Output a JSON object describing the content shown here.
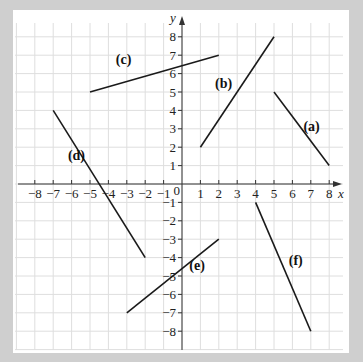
{
  "chart_data": {
    "type": "line",
    "title": "",
    "xlabel": "x",
    "ylabel": "y",
    "xlim": [
      -8,
      8
    ],
    "ylim": [
      -8,
      8
    ],
    "grid": true,
    "x_ticks": [
      -8,
      -7,
      -6,
      -5,
      -4,
      -3,
      -2,
      -1,
      1,
      2,
      3,
      4,
      5,
      6,
      7,
      8
    ],
    "y_ticks": [
      -8,
      -7,
      -6,
      -5,
      -4,
      -3,
      -2,
      -1,
      1,
      2,
      3,
      4,
      5,
      6,
      7,
      8
    ],
    "origin_label": "0",
    "series": [
      {
        "name": "(a)",
        "points": [
          [
            5,
            5
          ],
          [
            8,
            1
          ]
        ],
        "label_pos": [
          6.6,
          2.9
        ]
      },
      {
        "name": "(b)",
        "points": [
          [
            1,
            2
          ],
          [
            5,
            8
          ]
        ],
        "label_pos": [
          1.8,
          5.2
        ]
      },
      {
        "name": "(c)",
        "points": [
          [
            -5,
            5
          ],
          [
            2,
            7
          ]
        ],
        "label_pos": [
          -3.6,
          6.5
        ]
      },
      {
        "name": "(d)",
        "points": [
          [
            -7,
            4
          ],
          [
            -2,
            -4
          ]
        ],
        "label_pos": [
          -6.2,
          1.3
        ]
      },
      {
        "name": "(e)",
        "points": [
          [
            -3,
            -7
          ],
          [
            2,
            -3
          ]
        ],
        "label_pos": [
          0.4,
          -4.7
        ]
      },
      {
        "name": "(f)",
        "points": [
          [
            4,
            -1
          ],
          [
            7,
            -8
          ]
        ],
        "label_pos": [
          5.8,
          -4.4
        ]
      }
    ]
  },
  "layout": {
    "origin_px": [
      182,
      184
    ],
    "unit_px": 18.4,
    "line_color": "#1a1a1a",
    "grid_color": "#dedede",
    "background": "#cfcfcf",
    "panel": "#ffffff"
  }
}
